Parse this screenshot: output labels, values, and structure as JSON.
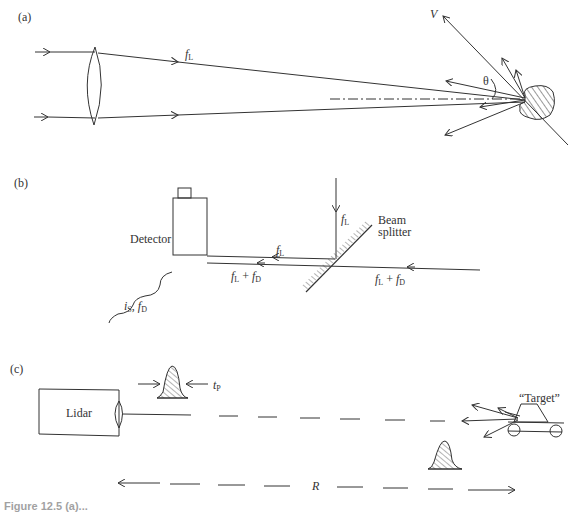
{
  "panels": {
    "a": {
      "label": "(a)",
      "focal_label": "f",
      "focal_sub": "L",
      "velocity_label": "V",
      "angle_label": "θ"
    },
    "b": {
      "label": "(b)",
      "detector_label": "Detector",
      "beam_splitter_line1": "Beam",
      "beam_splitter_line2": "splitter",
      "fL_top": {
        "f": "f",
        "sub": "L"
      },
      "fL_left": {
        "f": "f",
        "sub": "L"
      },
      "fLfD_left": {
        "f1": "f",
        "s1": "L",
        "plus": " + ",
        "f2": "f",
        "s2": "D"
      },
      "fLfD_right": {
        "f1": "f",
        "s1": "L",
        "plus": " + ",
        "f2": "f",
        "s2": "D"
      },
      "signal": {
        "i": "i",
        "is": "S",
        "sep": ", ",
        "f": "f",
        "fs": "D"
      }
    },
    "c": {
      "label": "(c)",
      "lidar_label": "Lidar",
      "pulse_width": {
        "t": "t",
        "sub": "P"
      },
      "target_label": "“Target”",
      "range_label": "R"
    }
  },
  "caption": "Figure 12.5 (a)..."
}
